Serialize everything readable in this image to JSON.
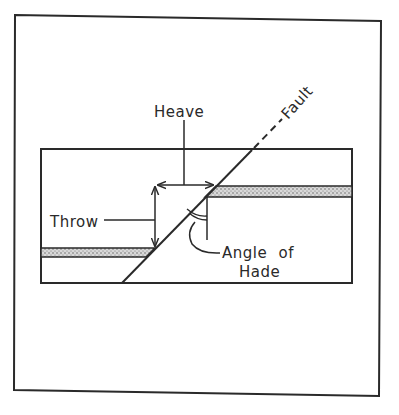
{
  "diagram": {
    "title": "",
    "labels": {
      "heave": "Heave",
      "throw": "Throw",
      "fault": "Fault",
      "angle_line1": "Angle of",
      "angle_line2": "Hade"
    },
    "colors": {
      "ink": "#2a2a2a",
      "background": "#ffffff",
      "stratum_fill": "#c9c9c9"
    },
    "elements": [
      "outer-frame",
      "cross-section-box",
      "fault-line",
      "fault-dashed-extension",
      "stratum-left-downthrown",
      "stratum-right-upthrown",
      "heave-arrow",
      "throw-arrow",
      "hade-angle-arc"
    ]
  }
}
